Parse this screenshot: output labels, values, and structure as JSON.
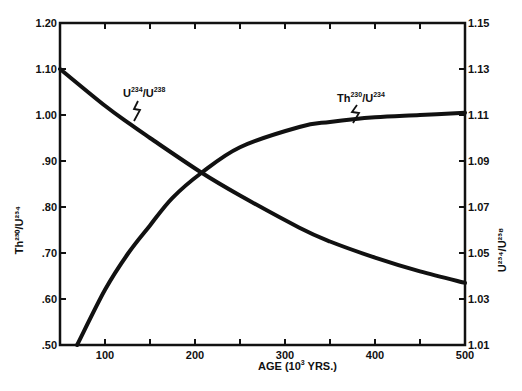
{
  "chart_data": {
    "type": "line",
    "title": "",
    "xlabel": "AGE (10³ YRS.)",
    "xlabel_parts": {
      "base": "AGE (10",
      "sup": "3",
      "tail": " YRS.)"
    },
    "xlim": [
      50,
      500
    ],
    "xticks": [
      100,
      200,
      300,
      400,
      500
    ],
    "xtick_labels": [
      "100",
      "200",
      "300",
      "400",
      "500"
    ],
    "xminor_ticks": [
      150,
      250,
      350,
      450
    ],
    "ylabel_left": "Th²³⁰/U²³⁴",
    "ylim_left": [
      0.5,
      1.2
    ],
    "yticks_left": [
      0.5,
      0.6,
      0.7,
      0.8,
      0.9,
      1.0,
      1.1,
      1.2
    ],
    "ytick_labels_left": [
      ".50",
      ".60",
      ".70",
      ".80",
      ".90",
      "1.00",
      "1.10",
      "1.20"
    ],
    "ylabel_right": "U²³⁴/U²³⁸",
    "ylim_right": [
      1.01,
      1.15
    ],
    "yticks_right": [
      1.01,
      1.03,
      1.05,
      1.07,
      1.09,
      1.11,
      1.13,
      1.15
    ],
    "ytick_labels_right": [
      "1.01",
      "1.03",
      "1.05",
      "1.07",
      "1.09",
      "1.11",
      "1.13",
      "1.15"
    ],
    "grid": false,
    "legend": "inline curve labels",
    "series": [
      {
        "name": "U²³⁴/U²³⁸",
        "axis": "right",
        "label_parts": {
          "a": "U",
          "a_sup": "234",
          "b": "/U",
          "b_sup": "238"
        },
        "x": [
          50,
          100,
          128,
          150,
          207,
          250,
          316,
          350,
          400,
          450,
          500
        ],
        "values": [
          1.13,
          1.114,
          1.106,
          1.1,
          1.085,
          1.075,
          1.061,
          1.055,
          1.048,
          1.042,
          1.037
        ]
      },
      {
        "name": "Th²³⁰/U²³⁴",
        "axis": "left",
        "label_parts": {
          "a": "Th",
          "a_sup": "230",
          "b": "/U",
          "b_sup": "234"
        },
        "x": [
          69,
          100,
          126,
          150,
          175,
          207,
          250,
          316,
          350,
          400,
          450,
          500
        ],
        "values": [
          0.5,
          0.62,
          0.7,
          0.76,
          0.82,
          0.874,
          0.93,
          0.974,
          0.985,
          0.995,
          1.0,
          1.005
        ]
      }
    ],
    "annotations": [
      {
        "text": "U²³⁴/U²³⁸",
        "near_x": 128,
        "points_to": "U²³⁴/U²³⁸ curve"
      },
      {
        "text": "Th²³⁰/U²³⁴",
        "near_x": 350,
        "points_to": "Th²³⁰/U²³⁴ curve"
      }
    ]
  },
  "colors": {
    "ink": "#111111",
    "background": "#ffffff"
  }
}
